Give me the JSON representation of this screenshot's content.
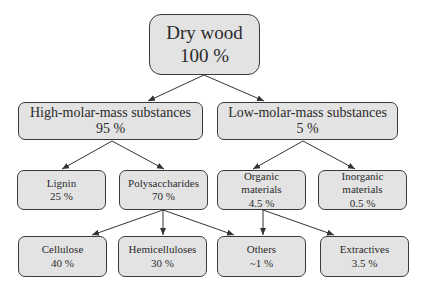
{
  "diagram": {
    "type": "hierarchy-tree",
    "colors": {
      "box_fill": "#e3e3e3",
      "box_border": "#3a3a3a",
      "arrow": "#333333",
      "text": "#2a2a2a"
    },
    "root": {
      "label": "Dry wood",
      "value": "100 %"
    },
    "level1": [
      {
        "id": "high",
        "label": "High-molar-mass substances",
        "value": "95 %"
      },
      {
        "id": "low",
        "label": "Low-molar-mass substances",
        "value": "5 %"
      }
    ],
    "level2": [
      {
        "id": "lignin",
        "label": "Lignin",
        "value": "25 %",
        "parent": "high"
      },
      {
        "id": "poly",
        "label": "Polysaccharides",
        "value": "70 %",
        "parent": "high"
      },
      {
        "id": "organic",
        "label_line1": "Organic",
        "label_line2": "materials",
        "value": "4.5 %",
        "parent": "low"
      },
      {
        "id": "inorganic",
        "label_line1": "Inorganic",
        "label_line2": "materials",
        "value": "0.5 %",
        "parent": "low"
      }
    ],
    "level3": [
      {
        "id": "cellulose",
        "label": "Cellulose",
        "value": "40 %",
        "parent": "poly"
      },
      {
        "id": "hemi",
        "label": "Hemicelluloses",
        "value": "30 %",
        "parent": "poly"
      },
      {
        "id": "others",
        "label": "Others",
        "value": "~1 %",
        "parent": [
          "poly",
          "organic"
        ]
      },
      {
        "id": "extractives",
        "label": "Extractives",
        "value": "3.5 %",
        "parent": "organic"
      }
    ]
  }
}
